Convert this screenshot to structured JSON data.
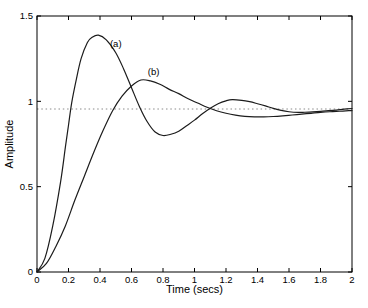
{
  "chart_data": {
    "type": "line",
    "title": "",
    "xlabel": "Time (secs)",
    "ylabel": "Amplitude",
    "xlim": [
      0,
      2
    ],
    "ylim": [
      0,
      1.5
    ],
    "xticks": [
      0,
      0.2,
      0.4,
      0.6,
      0.8,
      1,
      1.2,
      1.4,
      1.6,
      1.8,
      2
    ],
    "xtick_labels": [
      "0",
      "0.2",
      "0.4",
      "0.6",
      "0.8",
      "1",
      "1.2",
      "1.4",
      "1.6",
      "1.8",
      "2"
    ],
    "yticks": [
      0,
      0.5,
      1,
      1.5
    ],
    "ytick_labels": [
      "0",
      "0.5",
      "1",
      "1.5"
    ],
    "grid": false,
    "box": true,
    "legend": "none",
    "axis_color": "#000000",
    "line_color": "#1c1c1c",
    "steady_state_line": {
      "y": 0.955,
      "style": "dotted",
      "color": "#8a8a8a"
    },
    "series": [
      {
        "id": "a",
        "label": "(a)",
        "label_x": 0.5,
        "label_y": 1.335,
        "peak": {
          "t": 0.39,
          "amplitude": 1.39
        },
        "x": [
          0,
          0.05,
          0.1,
          0.15,
          0.18,
          0.2,
          0.22,
          0.25,
          0.28,
          0.32,
          0.35,
          0.39,
          0.44,
          0.5,
          0.55,
          0.6,
          0.65,
          0.7,
          0.75,
          0.8,
          0.85,
          0.9,
          0.95,
          1.0,
          1.05,
          1.1,
          1.15,
          1.2,
          1.24,
          1.3,
          1.35,
          1.4,
          1.45,
          1.5,
          1.55,
          1.6,
          1.66,
          1.7,
          1.75,
          1.8,
          1.85,
          1.9,
          1.95,
          2.0
        ],
        "y": [
          0,
          0.08,
          0.27,
          0.53,
          0.73,
          0.86,
          0.99,
          1.13,
          1.25,
          1.345,
          1.375,
          1.388,
          1.36,
          1.285,
          1.19,
          1.08,
          0.97,
          0.88,
          0.82,
          0.8,
          0.807,
          0.825,
          0.857,
          0.89,
          0.927,
          0.96,
          0.986,
          1.003,
          1.01,
          1.006,
          0.998,
          0.986,
          0.973,
          0.959,
          0.947,
          0.939,
          0.935,
          0.936,
          0.938,
          0.941,
          0.945,
          0.949,
          0.954,
          0.958
        ]
      },
      {
        "id": "b",
        "label": "(b)",
        "label_x": 0.74,
        "label_y": 1.17,
        "peak": {
          "t": 0.66,
          "amplitude": 1.125
        },
        "x": [
          0,
          0.06,
          0.12,
          0.18,
          0.24,
          0.3,
          0.36,
          0.42,
          0.48,
          0.54,
          0.6,
          0.66,
          0.72,
          0.78,
          0.84,
          0.9,
          0.96,
          1.02,
          1.08,
          1.14,
          1.2,
          1.26,
          1.32,
          1.38,
          1.44,
          1.5,
          1.56,
          1.62,
          1.68,
          1.74,
          1.8,
          1.86,
          1.92,
          1.98,
          2.0
        ],
        "y": [
          0,
          0.05,
          0.15,
          0.27,
          0.42,
          0.56,
          0.7,
          0.83,
          0.945,
          1.03,
          1.09,
          1.125,
          1.12,
          1.1,
          1.07,
          1.045,
          1.015,
          0.99,
          0.965,
          0.945,
          0.93,
          0.919,
          0.912,
          0.909,
          0.909,
          0.911,
          0.915,
          0.92,
          0.925,
          0.93,
          0.935,
          0.939,
          0.942,
          0.945,
          0.946
        ]
      }
    ]
  }
}
